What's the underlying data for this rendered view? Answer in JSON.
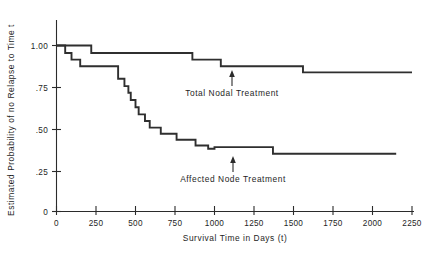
{
  "chart_data": {
    "type": "line",
    "subtype": "kaplan-meier-step",
    "title": "",
    "xlabel": "Survival Time in Days (t)",
    "ylabel": "Estimated Probability of no Relapse to Time t",
    "xlim": [
      0,
      2250
    ],
    "ylim": [
      0,
      1.0
    ],
    "xticks": [
      0,
      250,
      500,
      750,
      1000,
      1250,
      1500,
      1750,
      2000,
      2250
    ],
    "xticklabels": [
      "0",
      "250",
      "500",
      "750",
      "1000",
      "1250",
      "1500",
      "1750",
      "2000",
      "2250"
    ],
    "yticks": [
      0,
      0.25,
      0.5,
      0.75,
      1.0
    ],
    "yticklabels": [
      "0",
      ".25",
      ".50",
      ".75",
      "1.00"
    ],
    "grid": false,
    "legend_position": "inline-annotations",
    "annotations": [
      {
        "text": "Total Nodal Treatment",
        "points_to_series": "Total Nodal Treatment",
        "arrow": "up"
      },
      {
        "text": "Affected Node Treatment",
        "points_to_series": "Affected Node Treatment",
        "arrow": "up"
      }
    ],
    "series": [
      {
        "name": "Total Nodal Treatment",
        "color": "#2f2f2f",
        "steps": [
          {
            "x": 0,
            "y": 1.0
          },
          {
            "x": 220,
            "y": 1.0
          },
          {
            "x": 220,
            "y": 0.955
          },
          {
            "x": 860,
            "y": 0.955
          },
          {
            "x": 860,
            "y": 0.915
          },
          {
            "x": 1040,
            "y": 0.915
          },
          {
            "x": 1040,
            "y": 0.875
          },
          {
            "x": 1560,
            "y": 0.875
          },
          {
            "x": 1560,
            "y": 0.838
          },
          {
            "x": 2250,
            "y": 0.838
          }
        ]
      },
      {
        "name": "Affected Node Treatment",
        "color": "#2f2f2f",
        "steps": [
          {
            "x": 0,
            "y": 1.0
          },
          {
            "x": 55,
            "y": 1.0
          },
          {
            "x": 55,
            "y": 0.955
          },
          {
            "x": 95,
            "y": 0.955
          },
          {
            "x": 95,
            "y": 0.915
          },
          {
            "x": 150,
            "y": 0.915
          },
          {
            "x": 150,
            "y": 0.875
          },
          {
            "x": 390,
            "y": 0.875
          },
          {
            "x": 390,
            "y": 0.8
          },
          {
            "x": 430,
            "y": 0.8
          },
          {
            "x": 430,
            "y": 0.755
          },
          {
            "x": 455,
            "y": 0.755
          },
          {
            "x": 455,
            "y": 0.715
          },
          {
            "x": 470,
            "y": 0.715
          },
          {
            "x": 470,
            "y": 0.672
          },
          {
            "x": 500,
            "y": 0.672
          },
          {
            "x": 500,
            "y": 0.628
          },
          {
            "x": 520,
            "y": 0.628
          },
          {
            "x": 520,
            "y": 0.585
          },
          {
            "x": 560,
            "y": 0.585
          },
          {
            "x": 560,
            "y": 0.545
          },
          {
            "x": 590,
            "y": 0.545
          },
          {
            "x": 590,
            "y": 0.505
          },
          {
            "x": 660,
            "y": 0.505
          },
          {
            "x": 660,
            "y": 0.468
          },
          {
            "x": 760,
            "y": 0.468
          },
          {
            "x": 760,
            "y": 0.432
          },
          {
            "x": 880,
            "y": 0.432
          },
          {
            "x": 880,
            "y": 0.398
          },
          {
            "x": 960,
            "y": 0.398
          },
          {
            "x": 960,
            "y": 0.378
          },
          {
            "x": 1000,
            "y": 0.378
          },
          {
            "x": 1000,
            "y": 0.388
          },
          {
            "x": 1370,
            "y": 0.388
          },
          {
            "x": 1370,
            "y": 0.348
          },
          {
            "x": 2150,
            "y": 0.348
          }
        ]
      }
    ]
  }
}
